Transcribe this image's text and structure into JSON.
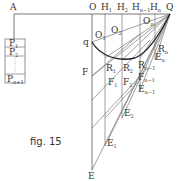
{
  "figure": {
    "caption": "fig. 15",
    "points": {
      "A": "A",
      "O": "O",
      "Q": "Q",
      "q": "q",
      "E": "E",
      "F": "F",
      "H1": "H",
      "H1_sub": "1",
      "H2": "H",
      "H2_sub": "2",
      "Hn1": "H",
      "Hn1_sub": "n−1",
      "Hn": "H",
      "Hn_sub": "n",
      "O1": "O",
      "O1_sub": "1",
      "O2": "O",
      "O2_sub": "2",
      "On": "O",
      "On_sub": "n",
      "R1": "R",
      "R1_sub": "1",
      "R2": "R",
      "R2_sub": "2",
      "Rn1": "R",
      "Rn1_sub": "n−1",
      "Rn": "R",
      "Rn_sub": "n",
      "F1": "F",
      "F1_sub": "1",
      "F2": "F",
      "F2_sub": "2",
      "Fn1": "F",
      "Fn1_sub": "n−1",
      "E1": "E",
      "E1_sub": "1",
      "E2": "E",
      "E2_sub": "2",
      "En1": "E",
      "En1_sub": "n−1",
      "En": "E",
      "En_sub": "n"
    },
    "weights": [
      {
        "label": "P",
        "sub": "1"
      },
      {
        "label": "P",
        "sub": "2"
      },
      {
        "label": "",
        "sub": ""
      },
      {
        "label": "P",
        "sub": "n+1"
      }
    ]
  }
}
